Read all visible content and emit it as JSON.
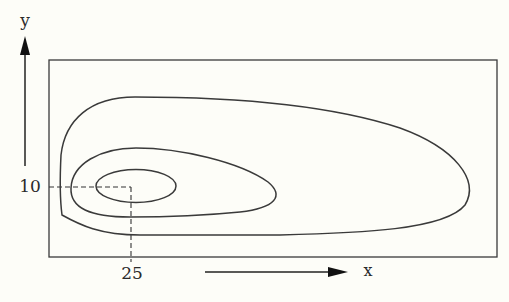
{
  "diagram": {
    "type": "contour-plot",
    "axes": {
      "x_label": "x",
      "y_label": "y"
    },
    "marked_point": {
      "x_value": "25",
      "y_value": "10"
    },
    "contours": [
      {
        "name": "inner",
        "description": "small ellipse centered near (25, 10)"
      },
      {
        "name": "middle",
        "description": "egg-shaped loop extending rightward"
      },
      {
        "name": "outer",
        "description": "long teardrop loop extending far right"
      }
    ],
    "colors": {
      "line": "#3a3a3a",
      "background": "#fdfdf8"
    }
  }
}
